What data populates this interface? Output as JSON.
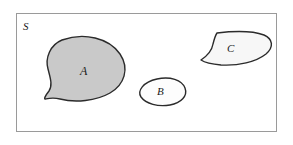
{
  "figure": {
    "type": "venn-style-set-diagram",
    "universe": {
      "label": "S",
      "frame": {
        "x": 16,
        "y": 13,
        "width": 261,
        "height": 119,
        "stroke_color": "#9a9a9a",
        "fill_color": "#ffffff"
      }
    },
    "sets": [
      {
        "id": "A",
        "label": "A",
        "fill_color": "#c9c9c9",
        "stroke_color": "#2b2b2b",
        "shape": "teardrop-blob",
        "label_position": {
          "x": 80,
          "y": 65
        },
        "path": "M 62 40 C 84 32 109 38 120 54 C 130 69 124 85 110 93 C 96 101 75 103 60 99 C 52 97 46 99 45 99 C 44 99 45 96 49 91 C 53 85 50 77 48 69 C 45 58 50 45 62 40 Z"
      },
      {
        "id": "B",
        "label": "B",
        "fill_color": "#fdfdfd",
        "stroke_color": "#2b2b2b",
        "shape": "rounded-blob",
        "label_position": {
          "x": 157,
          "y": 86
        },
        "path": "M 157 79 C 170 76 182 80 185 88 C 188 96 181 103 170 105 C 158 107 146 104 141 97 C 137 91 143 82 157 79 Z"
      },
      {
        "id": "C",
        "label": "C",
        "fill_color": "#f7f7f7",
        "stroke_color": "#2b2b2b",
        "shape": "crescent-fan-blob",
        "label_position": {
          "x": 227,
          "y": 43
        },
        "path": "M 217 33 C 234 31 253 31 264 35 C 273 39 274 47 266 54 C 256 62 238 66 221 65 C 210 64 204 62 201 60 C 207 56 212 50 213 44 C 214 40 215 36 217 33 Z"
      }
    ],
    "stroke_width": 1.4
  }
}
